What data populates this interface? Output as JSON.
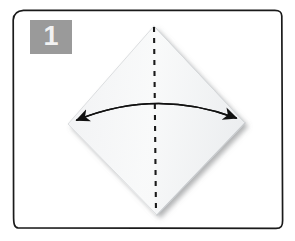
{
  "figure": {
    "kind": "origami-instruction-step",
    "step_number": "1",
    "caption": "",
    "background_color": "#ffffff",
    "frame": {
      "name": "hand-drawn-rounded-rectangle",
      "stroke_color": "#1a1a1a",
      "fill_color": "#ffffff",
      "stroke_width": 1.6,
      "x": 13,
      "y": 10,
      "width": 270,
      "height": 218,
      "corner_radius": 10
    },
    "step_badge": {
      "number": "1",
      "background_color": "#9a9a9a",
      "text_color": "#f2f2f2",
      "x": 30,
      "y": 20,
      "width": 42,
      "height": 34
    },
    "paper": {
      "name": "square-sheet-rotated-45",
      "shape": "diamond",
      "fill_color": "#f4f5f6",
      "edge_color": "#d9dbdd",
      "shadow_color": "#8d9094",
      "vertices": {
        "top": [
          154,
          26
        ],
        "right": [
          245,
          123
        ],
        "bottom": [
          157,
          215
        ],
        "left": [
          68,
          124
        ]
      }
    },
    "fold_line": {
      "name": "valley-fold-dashed-line",
      "style": "dashed",
      "color": "#1a1a1a",
      "stroke_width": 2.1,
      "dash_pattern": "5 6",
      "from": [
        154,
        27
      ],
      "to": [
        156,
        214
      ],
      "orientation": "vertical"
    },
    "motion_arrow": {
      "name": "double-headed-curved-fold-arrow",
      "color": "#111111",
      "stroke_width": 1.7,
      "heads": "both",
      "direction": "left-right",
      "start": [
        75,
        121
      ],
      "control": [
        156,
        88
      ],
      "end": [
        238,
        119
      ],
      "left_arrow_tip": [
        69,
        125
      ],
      "right_arrow_tip": [
        244,
        123
      ]
    }
  }
}
